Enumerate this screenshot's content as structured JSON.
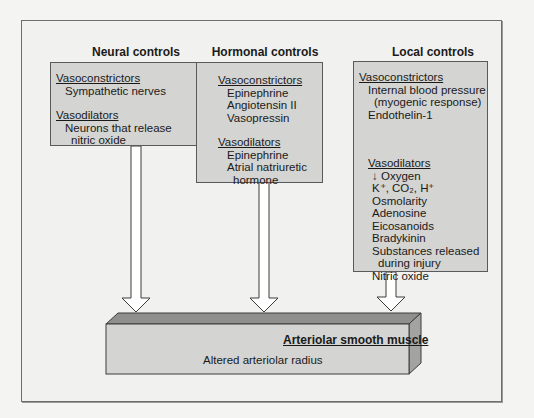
{
  "columns": [
    {
      "heading": "Neural controls",
      "vasoconstrictors_label": "Vasoconstrictors",
      "vasoconstrictors": [
        "Sympathetic nerves"
      ],
      "vasodilators_label": "Vasodilators",
      "vasodilators": [
        "Neurons that release",
        "nitric oxide"
      ]
    },
    {
      "heading": "Hormonal controls",
      "vasoconstrictors_label": "Vasoconstrictors",
      "vasoconstrictors": [
        "Epinephrine",
        "Angiotensin II",
        "Vasopressin"
      ],
      "vasodilators_label": "Vasodilators",
      "vasodilators": [
        "Epinephrine",
        "Atrial natriuretic",
        "hormone"
      ]
    },
    {
      "heading": "Local controls",
      "vasoconstrictors_label": "Vasoconstrictors",
      "vasoconstrictors": [
        "Internal blood pressure",
        "(myogenic response)",
        "Endothelin-1"
      ],
      "vasodilators_label": "Vasodilators",
      "vasodilators": [
        "↓ Oxygen",
        "K⁺, CO₂, H⁺",
        "Osmolarity",
        "Adenosine",
        "Eicosanoids",
        "Bradykinin",
        "Substances released",
        "during injury",
        "Nitric oxide"
      ]
    }
  ],
  "target": {
    "title": "Arteriolar smooth muscle",
    "subtitle": "Altered arteriolar radius"
  },
  "colors": {
    "background": "#f1f1ef",
    "box_fill": "#d4d4d2",
    "box_top": "#8f8f8d",
    "box_side": "#a3a3a1",
    "border": "#5a5a5a"
  }
}
